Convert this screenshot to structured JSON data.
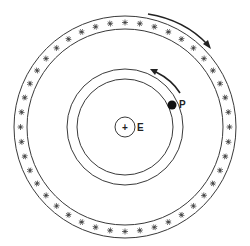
{
  "diagram": {
    "type": "geocentric-cosmos",
    "labels": {
      "earth": "E",
      "planet": "P"
    },
    "center": {
      "x": 125,
      "y": 127
    },
    "celestial_sphere": {
      "outer_radius": 111,
      "inner_radius": 98,
      "star_count": 44,
      "motion": "clockwise"
    },
    "planet_orbit": {
      "outer_radius": 58,
      "inner_radius": 48,
      "motion": "counterclockwise"
    },
    "earth": {
      "radius": 10,
      "symbol": "+"
    },
    "planet": {
      "x": 172,
      "y": 105,
      "radius": 4.5
    },
    "colors": {
      "line": "#3a3a3a",
      "star": "#444444",
      "fill": "#111111",
      "background": "#ffffff"
    }
  }
}
